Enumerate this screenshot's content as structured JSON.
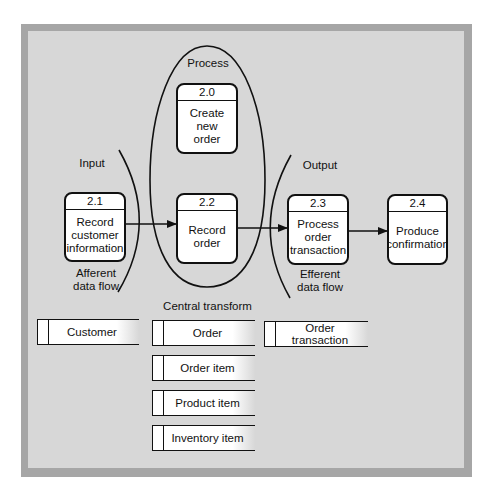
{
  "regions": {
    "process": "Process",
    "input": "Input",
    "output": "Output",
    "afferent": "Afferent\ndata flow",
    "efferent": "Efferent\ndata flow",
    "central_transform": "Central transform"
  },
  "processes": [
    {
      "id": "2.0",
      "title": "Create new\norder"
    },
    {
      "id": "2.1",
      "title": "Record\ncustomer\ninformation"
    },
    {
      "id": "2.2",
      "title": "Record\norder"
    },
    {
      "id": "2.3",
      "title": "Process\norder\ntransaction"
    },
    {
      "id": "2.4",
      "title": "Produce\nconfirmation"
    }
  ],
  "data_stores": [
    {
      "name": "Customer"
    },
    {
      "name": "Order"
    },
    {
      "name": "Order transaction"
    },
    {
      "name": "Order item"
    },
    {
      "name": "Product item"
    },
    {
      "name": "Inventory item"
    }
  ],
  "flows": [
    {
      "from": "2.1",
      "to": "2.2"
    },
    {
      "from": "2.2",
      "to": "2.3"
    },
    {
      "from": "2.3",
      "to": "2.4"
    }
  ],
  "colors": {
    "frame": "#a6a6a6",
    "panel": "#d7d7d7",
    "box": "#ffffff",
    "line": "#111111"
  }
}
